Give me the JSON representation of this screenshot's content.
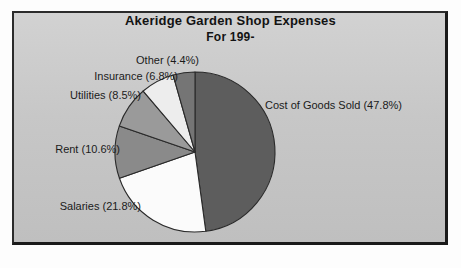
{
  "chart_data": {
    "type": "pie",
    "title": "Akeridge Garden Shop Expenses",
    "subtitle": "For 199-",
    "xlabel": "",
    "ylabel": "",
    "legend_position": "none",
    "grid": false,
    "value_unit": "percent",
    "categories": [
      "Cost of Goods Sold",
      "Salaries",
      "Rent",
      "Utilities",
      "Insurance",
      "Other"
    ],
    "values": [
      47.8,
      21.8,
      10.6,
      8.5,
      6.8,
      4.4
    ],
    "slices": [
      {
        "label": "Cost of Goods Sold",
        "value": 47.8,
        "text": "Cost of Goods Sold (47.8%)",
        "color": "#5d5d5d"
      },
      {
        "label": "Salaries",
        "value": 21.8,
        "text": "Salaries (21.8%)",
        "color": "#fbfbfb"
      },
      {
        "label": "Rent",
        "value": 10.6,
        "text": "Rent (10.6%)",
        "color": "#8a8a8a"
      },
      {
        "label": "Utilities",
        "value": 8.5,
        "text": "Utilities (8.5%)",
        "color": "#9a9a9a"
      },
      {
        "label": "Insurance",
        "value": 6.8,
        "text": "Insurance (6.8%)",
        "color": "#ededed"
      },
      {
        "label": "Other",
        "value": 4.4,
        "text": "Other (4.4%)",
        "color": "#757575"
      }
    ],
    "panel_color": "#c9c9c9",
    "border_color": "#1f1f1f",
    "outline_color": "#2a2a2a",
    "start_angle_deg": 0,
    "direction": "clockwise"
  }
}
